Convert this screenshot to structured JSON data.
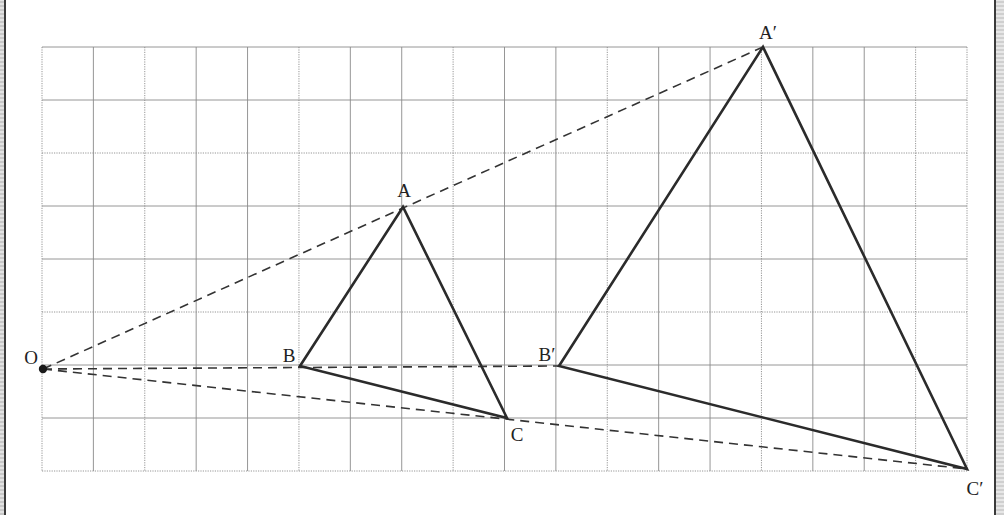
{
  "diagram": {
    "title": "",
    "grid": {
      "x0": 42,
      "x1": 967,
      "cols": 18,
      "y0": 47,
      "y1": 471,
      "rows": 8,
      "line_color": "#8a8a8a"
    },
    "center": {
      "label": "O",
      "x": 43,
      "y": 369,
      "label_x": 31,
      "label_y": 364
    },
    "original_triangle": {
      "vertices": [
        {
          "label": "A",
          "x": 403,
          "y": 207,
          "label_x": 404,
          "label_y": 197
        },
        {
          "label": "B",
          "x": 300,
          "y": 366,
          "label_x": 289,
          "label_y": 362
        },
        {
          "label": "C",
          "x": 507,
          "y": 418,
          "label_x": 517,
          "label_y": 441
        }
      ]
    },
    "image_triangle": {
      "vertices": [
        {
          "label": "A′",
          "x": 763,
          "y": 47,
          "label_x": 768,
          "label_y": 39
        },
        {
          "label": "B′",
          "x": 559,
          "y": 366,
          "label_x": 547,
          "label_y": 361
        },
        {
          "label": "C′",
          "x": 967,
          "y": 469,
          "label_x": 975,
          "label_y": 495
        }
      ]
    },
    "scale_factor": 2,
    "colors": {
      "triangle_stroke": "#2b2b2b",
      "dashed_ray": "#333333",
      "grid": "#8a8a8a",
      "label": "#222222"
    }
  }
}
